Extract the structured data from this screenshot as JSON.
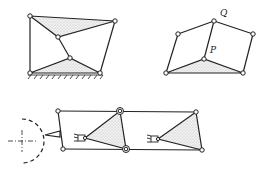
{
  "figure": {
    "colors": {
      "line": "#222222",
      "fill_dots": "#bbbbbb",
      "background": "#ffffff"
    },
    "labels": {
      "Q": "Q",
      "P": "P"
    }
  }
}
